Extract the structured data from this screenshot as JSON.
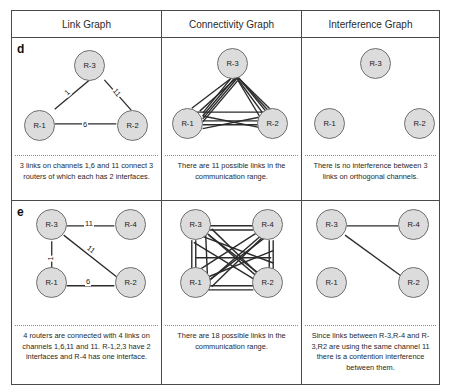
{
  "figure": {
    "columns": [
      {
        "id": "link-graph",
        "title": "Link Graph"
      },
      {
        "id": "connectivity-graph",
        "title": "Connectivity Graph"
      },
      {
        "id": "interference-graph",
        "title": "Interference Graph"
      }
    ],
    "rows": [
      {
        "letter": "d",
        "cells": {
          "link": {
            "caption": "3 links on channels 1,6 and 11 connect 3 routers of which each has 2 interfaces.",
            "nodes": [
              {
                "id": "R-3",
                "label": "R-3",
                "x": 62,
                "y": 12
              },
              {
                "id": "R-1",
                "label": "R-1",
                "x": 12,
                "y": 72
              },
              {
                "id": "R-2",
                "label": "R-2",
                "x": 105,
                "y": 72
              }
            ],
            "edges": [
              {
                "from": "R-1",
                "to": "R-3",
                "label": "1"
              },
              {
                "from": "R-3",
                "to": "R-2",
                "label": "11"
              },
              {
                "from": "R-1",
                "to": "R-2",
                "label": "6"
              }
            ]
          },
          "connectivity": {
            "caption": "There are 11 possible links in the communication range.",
            "nodes": [
              {
                "id": "R-3",
                "label": "R-3",
                "x": 55,
                "y": 10
              },
              {
                "id": "R-1",
                "label": "R-1",
                "x": 10,
                "y": 70
              },
              {
                "id": "R-2",
                "label": "R-2",
                "x": 95,
                "y": 70
              }
            ],
            "link_count": 11
          },
          "interference": {
            "caption": "There is no interference between 3 links on orthogonal channels.",
            "nodes": [
              {
                "id": "R-3",
                "label": "R-3",
                "x": 58,
                "y": 10
              },
              {
                "id": "R-1",
                "label": "R-1",
                "x": 12,
                "y": 70
              },
              {
                "id": "R-2",
                "label": "R-2",
                "x": 102,
                "y": 70
              }
            ],
            "edges": []
          }
        }
      },
      {
        "letter": "e",
        "cells": {
          "link": {
            "caption": "4 routers are connected with 4 links on channels 1,6,11 and 11. R-1,2,3 have 2 interfaces and R-4 has one interface.",
            "nodes": [
              {
                "id": "R-3",
                "label": "R-3",
                "x": 24,
                "y": 8
              },
              {
                "id": "R-4",
                "label": "R-4",
                "x": 103,
                "y": 8
              },
              {
                "id": "R-1",
                "label": "R-1",
                "x": 24,
                "y": 66
              },
              {
                "id": "R-2",
                "label": "R-2",
                "x": 103,
                "y": 66
              }
            ],
            "edges": [
              {
                "from": "R-3",
                "to": "R-4",
                "label": "11"
              },
              {
                "from": "R-3",
                "to": "R-2",
                "label": "11"
              },
              {
                "from": "R-3",
                "to": "R-1",
                "label": "1"
              },
              {
                "from": "R-1",
                "to": "R-2",
                "label": "6"
              }
            ]
          },
          "connectivity": {
            "caption": "There are 18 possible links in the communication range.",
            "nodes": [
              {
                "id": "R-3",
                "label": "R-3",
                "x": 18,
                "y": 8
              },
              {
                "id": "R-4",
                "label": "R-4",
                "x": 90,
                "y": 8
              },
              {
                "id": "R-1",
                "label": "R-1",
                "x": 18,
                "y": 66
              },
              {
                "id": "R-2",
                "label": "R-2",
                "x": 90,
                "y": 66
              }
            ],
            "link_count": 18
          },
          "interference": {
            "caption": "Since links between R-3,R-4 and R-3,R2 are using the same channel 11 there is a contention interference between them.",
            "nodes": [
              {
                "id": "R-3",
                "label": "R-3",
                "x": 14,
                "y": 8
              },
              {
                "id": "R-4",
                "label": "R-4",
                "x": 96,
                "y": 8
              },
              {
                "id": "R-1",
                "label": "R-1",
                "x": 14,
                "y": 66
              },
              {
                "id": "R-2",
                "label": "R-2",
                "x": 96,
                "y": 66
              }
            ],
            "edges": [
              {
                "from": "R-3",
                "to": "R-4"
              },
              {
                "from": "R-3",
                "to": "R-2"
              }
            ]
          }
        }
      }
    ]
  },
  "colors": {
    "node_fill": "#dcdcdc",
    "node_stroke": "#6f6f6f",
    "edge": "#2b2b2b",
    "frame": "#4a4a4a"
  }
}
